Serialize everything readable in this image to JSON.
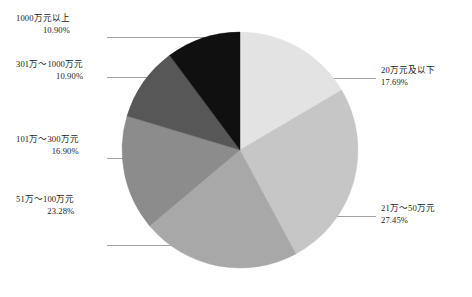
{
  "chart_data": {
    "type": "pie",
    "title": "",
    "subtitle": "",
    "legend_position": "callout-labels",
    "grid": false,
    "start_angle_deg": 0,
    "direction": "clockwise",
    "units": "percent",
    "categories": [
      "20万元及以下",
      "21万～50万元",
      "51万～100万元",
      "101万～300万元",
      "301万～1000万元",
      "1000万元以上"
    ],
    "values": [
      17.69,
      27.45,
      23.28,
      16.9,
      10.9,
      10.9
    ],
    "value_labels": [
      "17.69%",
      "27.45%",
      "23.28%",
      "16.90%",
      "10.90%",
      "10.90%"
    ],
    "colors": [
      "#e2e2e2",
      "#c4c4c4",
      "#a6a6a6",
      "#8d8d8d",
      "#6b6b6b",
      "#3c3c3c",
      "#111111"
    ]
  },
  "slices": [
    {
      "name": "slice-20wan-and-below",
      "category": "20万元及以下",
      "percent_label": "17.69%",
      "value": 17.69,
      "color": "#e3e3e3"
    },
    {
      "name": "slice-21wan-to-50wan",
      "category": "21万～50万元",
      "percent_label": "27.45%",
      "value": 27.45,
      "color": "#c6c6c6"
    },
    {
      "name": "slice-51wan-to-100wan",
      "category": "51万～100万元",
      "percent_label": "23.28%",
      "value": 23.28,
      "color": "#a8a8a8"
    },
    {
      "name": "slice-101wan-to-300wan",
      "category": "101万～300万元",
      "percent_label": "16.90%",
      "value": 16.9,
      "color": "#8c8c8c"
    },
    {
      "name": "slice-301wan-to-1000wan",
      "category": "301万～1000万元",
      "percent_label": "10.90%",
      "value": 10.9,
      "color": "#575757"
    },
    {
      "name": "slice-above-1000wan",
      "category": "1000万元以上",
      "percent_label": "10.90%",
      "value": 10.9,
      "color": "#101010"
    }
  ],
  "callouts": {
    "c0": {
      "category": "51万～100万元",
      "percent": "23.28%"
    },
    "c1": {
      "category": "101万～300万元",
      "percent": "16.90%"
    },
    "c2": {
      "category": "301万～1000万元",
      "percent": "10.90%"
    },
    "c3": {
      "category": "1000万元以上",
      "percent": "10.90%"
    },
    "c4": {
      "category": "20万元及以下",
      "percent": "17.69%"
    },
    "c5": {
      "category": "21万～50万元",
      "percent": "27.45%"
    }
  },
  "style": {
    "background": "#ffffff",
    "leader_line_color": "#9a9a9a",
    "text_color": "#1b1b1b"
  }
}
